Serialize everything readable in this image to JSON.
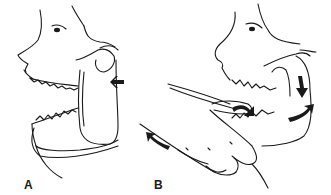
{
  "figure": {
    "panels": [
      {
        "id": "A",
        "label": "A",
        "description": "Dislocated mandible, lateral view; arrow indicates condyle position anterior to articular eminence"
      },
      {
        "id": "B",
        "label": "B",
        "description": "Reduction maneuver: thumbs on molars, downward then backward pressure on mandible"
      }
    ]
  }
}
